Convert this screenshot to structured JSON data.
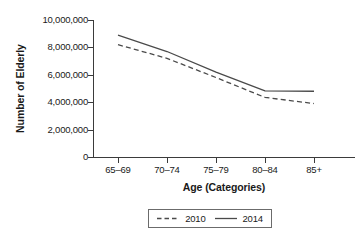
{
  "chart_data": {
    "type": "line",
    "title": "",
    "xlabel": "Age (Categories)",
    "ylabel": "Number of Elderly",
    "categories": [
      "65–69",
      "70–74",
      "75–79",
      "80–84",
      "85+"
    ],
    "series": [
      {
        "name": "2010",
        "style": "dashed",
        "color": "#4a4a4a",
        "values": [
          8200000,
          7200000,
          5800000,
          4350000,
          3900000
        ]
      },
      {
        "name": "2014",
        "style": "solid",
        "color": "#4a4a4a",
        "values": [
          8900000,
          7700000,
          6200000,
          4820000,
          4800000
        ]
      }
    ],
    "ylim": [
      0,
      10000000
    ],
    "ytick_values": [
      0,
      2000000,
      4000000,
      6000000,
      8000000,
      10000000
    ],
    "ytick_labels": [
      "0",
      "2,000,000",
      "4,000,000",
      "6,000,000",
      "8,000,000",
      "10,000,000"
    ],
    "grid": false,
    "legend_position": "bottom-center",
    "legend_entries": [
      {
        "label": "2010",
        "style": "dashed"
      },
      {
        "label": "2014",
        "style": "solid"
      }
    ]
  },
  "axes": {
    "y_title": "Number of Elderly",
    "x_title": "Age (Categories)"
  }
}
